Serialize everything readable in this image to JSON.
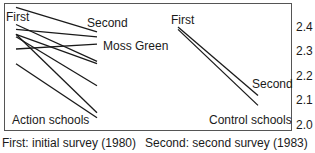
{
  "chart_data": {
    "type": "line",
    "title": "",
    "xlabel": "",
    "ylabel": "",
    "x": [
      "First",
      "Second"
    ],
    "ylim": [
      2.0,
      2.45
    ],
    "yticks": [
      "2.4",
      "2.3",
      "2.2",
      "2.1",
      "2.0"
    ],
    "panels": [
      {
        "name": "Action schools",
        "series": [
          {
            "name": "",
            "values": [
              2.48,
              2.38
            ]
          },
          {
            "name": "",
            "values": [
              2.41,
              2.26
            ]
          },
          {
            "name": "",
            "values": [
              2.39,
              2.36
            ]
          },
          {
            "name": "",
            "values": [
              2.37,
              2.05
            ]
          },
          {
            "name": "",
            "values": [
              2.36,
              2.16
            ]
          },
          {
            "name": "",
            "values": [
              2.37,
              2.25
            ]
          },
          {
            "name": "Moss Green",
            "values": [
              2.31,
              2.33
            ]
          },
          {
            "name": "",
            "values": [
              2.25,
              2.03
            ]
          }
        ]
      },
      {
        "name": "Control schools",
        "series": [
          {
            "name": "",
            "values": [
              2.4,
              2.12
            ]
          },
          {
            "name": "",
            "values": [
              2.39,
              2.08
            ]
          }
        ]
      }
    ],
    "annotations": [
      "First",
      "Second",
      "Moss Green",
      "Action schools",
      "First",
      "Second",
      "Control schools"
    ],
    "legend": [
      "First: initial survey (1980)",
      "Second: second survey (1983)"
    ],
    "grid": false
  },
  "labels": {
    "left_first": "First",
    "left_second": "Second",
    "moss_green": "Moss Green",
    "action_schools": "Action schools",
    "right_first": "First",
    "right_second": "Second",
    "control_schools": "Control schools",
    "legend_first": "First: initial survey (1980)",
    "legend_second": "Second: second survey (1983)"
  },
  "ticks": [
    "2.4",
    "2.3",
    "2.2",
    "2.1",
    "2.0"
  ]
}
